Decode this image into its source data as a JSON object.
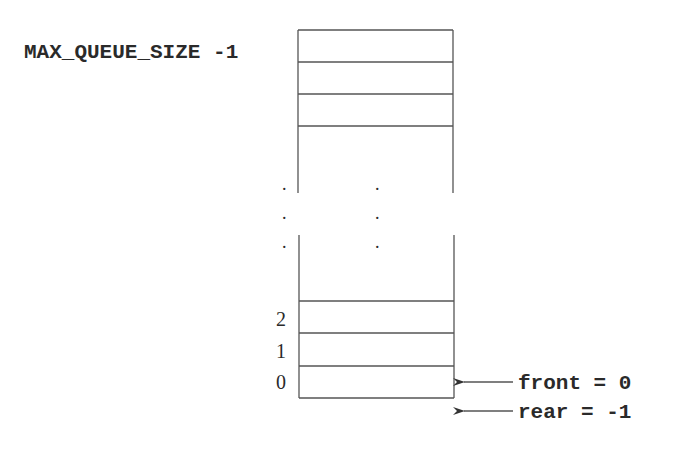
{
  "diagram": {
    "top_label": "MAX_QUEUE_SIZE -1",
    "index_labels": [
      "2",
      "1",
      "0"
    ],
    "ellipsis_dot": ".",
    "pointers": [
      {
        "name": "front",
        "label": "front = 0",
        "points_to": "index 0"
      },
      {
        "name": "rear",
        "label": "rear = -1",
        "points_to": "below index 0"
      }
    ],
    "colors": {
      "line": "#555555",
      "text": "#2a2a2a",
      "background": "#ffffff"
    }
  }
}
